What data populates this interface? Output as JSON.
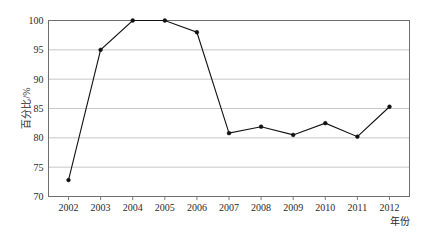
{
  "chart_data": {
    "type": "line",
    "title": "",
    "subtitle": "",
    "xlabel": "年份",
    "ylabel": "百分比/%",
    "categories": [
      "2002",
      "2003",
      "2004",
      "2005",
      "2006",
      "2007",
      "2008",
      "2009",
      "2010",
      "2011",
      "2012"
    ],
    "values": [
      72.8,
      95.0,
      100.0,
      100.0,
      98.0,
      80.8,
      81.9,
      80.5,
      82.5,
      80.2,
      85.3
    ],
    "x": [
      2002,
      2003,
      2004,
      2005,
      2006,
      2007,
      2008,
      2009,
      2010,
      2011,
      2012
    ],
    "ylim": [
      70,
      100
    ],
    "y_ticks": [
      70,
      75,
      80,
      85,
      90,
      95,
      100
    ],
    "y_tick_labels": [
      "70",
      "75",
      "80",
      "85",
      "90",
      "95",
      "100"
    ],
    "x_tick_labels": [
      "2002",
      "2003",
      "2004",
      "2005",
      "2006",
      "2007",
      "2008",
      "2009",
      "2010",
      "2011",
      "2012"
    ],
    "grid": "horizontal",
    "legend": "none",
    "legend_entries": [],
    "annotations": [],
    "series": [
      {
        "name": "百分比",
        "values": [
          72.8,
          95.0,
          100.0,
          100.0,
          98.0,
          80.8,
          81.9,
          80.5,
          82.5,
          80.2,
          85.3
        ],
        "line_color": "#111111",
        "marker": "dot"
      }
    ],
    "colors": {
      "line": "#111111",
      "marker": "#111111",
      "grid": "#b9b9b9",
      "axis": "#6f6f6f",
      "text": "#2b2b2b",
      "background": "#ffffff"
    }
  },
  "y_axis": {
    "label": "百分比/%",
    "ticks": [
      "100",
      "95",
      "90",
      "85",
      "80",
      "75",
      "70"
    ]
  },
  "x_axis": {
    "label": "年份",
    "ticks": [
      "2002",
      "2003",
      "2004",
      "2005",
      "2006",
      "2007",
      "2008",
      "2009",
      "2010",
      "2011",
      "2012"
    ]
  }
}
